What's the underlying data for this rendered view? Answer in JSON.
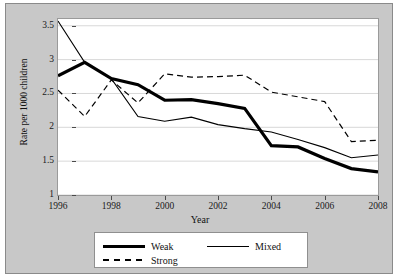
{
  "chart_data": {
    "type": "line",
    "title": "",
    "xlabel": "Year",
    "ylabel": "Rate per 1000 children",
    "x": [
      1996,
      1997,
      1998,
      1999,
      2000,
      2001,
      2002,
      2003,
      2004,
      2005,
      2006,
      2007,
      2008
    ],
    "xlim": [
      1996,
      2008
    ],
    "ylim": [
      1,
      3.6
    ],
    "xticks": [
      1996,
      1998,
      2000,
      2002,
      2004,
      2006,
      2008
    ],
    "xtick_labels": [
      "1996",
      "1998",
      "2000",
      "2002",
      "2004",
      "2006",
      "2008"
    ],
    "yticks": [
      1,
      1.5,
      2,
      2.5,
      3,
      3.5
    ],
    "ytick_labels": [
      "1",
      "1.5",
      "2",
      "2.5",
      "3",
      "3.5"
    ],
    "grid": "horizontal",
    "legend_position": "below-center",
    "series": [
      {
        "name": "Weak",
        "style": "thick-solid",
        "color": "#000000",
        "values": [
          2.76,
          2.96,
          2.72,
          2.63,
          2.4,
          2.41,
          2.35,
          2.28,
          1.73,
          1.71,
          1.54,
          1.39,
          1.34
        ]
      },
      {
        "name": "Mixed",
        "style": "thin-solid",
        "color": "#000000",
        "values": [
          3.57,
          2.96,
          2.72,
          2.16,
          2.09,
          2.15,
          2.04,
          1.98,
          1.93,
          1.82,
          1.7,
          1.55,
          1.59
        ]
      },
      {
        "name": "Strong",
        "style": "dashed",
        "color": "#000000",
        "values": [
          2.55,
          2.16,
          2.7,
          2.36,
          2.79,
          2.74,
          2.75,
          2.77,
          2.52,
          2.45,
          2.38,
          1.79,
          1.81
        ]
      }
    ]
  },
  "legend": {
    "items": [
      {
        "label": "Weak"
      },
      {
        "label": "Mixed"
      },
      {
        "label": "Strong"
      }
    ]
  }
}
